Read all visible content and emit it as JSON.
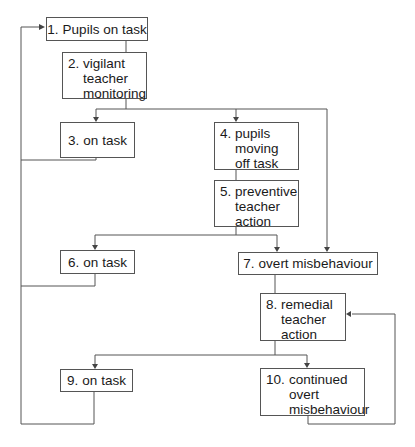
{
  "diagram": {
    "type": "flowchart",
    "nodes": [
      {
        "id": 1,
        "num": "1.",
        "label": "Pupils on task"
      },
      {
        "id": 2,
        "num": "2.",
        "label": "vigilant teacher monitoring",
        "lines": [
          "vigilant",
          "teacher",
          "monitoring"
        ]
      },
      {
        "id": 3,
        "num": "3.",
        "label": "on task"
      },
      {
        "id": 4,
        "num": "4.",
        "label": "pupils moving off task",
        "lines": [
          "pupils",
          "moving",
          "off task"
        ]
      },
      {
        "id": 5,
        "num": "5.",
        "label": "preventive teacher action",
        "lines": [
          "preventive",
          "teacher",
          "action"
        ]
      },
      {
        "id": 6,
        "num": "6.",
        "label": "on task"
      },
      {
        "id": 7,
        "num": "7.",
        "label": "overt misbehaviour"
      },
      {
        "id": 8,
        "num": "8.",
        "label": "remedial teacher action",
        "lines": [
          "remedial",
          "teacher",
          "action"
        ]
      },
      {
        "id": 9,
        "num": "9.",
        "label": "on task"
      },
      {
        "id": 10,
        "num": "10.",
        "label": "continued overt misbehaviour",
        "lines": [
          "continued",
          "overt",
          "misbehaviour"
        ]
      }
    ],
    "edges": [
      {
        "from": 1,
        "to": 2
      },
      {
        "from": 2,
        "to": 3
      },
      {
        "from": 2,
        "to": 4
      },
      {
        "from": 2,
        "to": 7
      },
      {
        "from": 4,
        "to": 5
      },
      {
        "from": 5,
        "to": 6
      },
      {
        "from": 5,
        "to": 7
      },
      {
        "from": 7,
        "to": 8
      },
      {
        "from": 8,
        "to": 9
      },
      {
        "from": 8,
        "to": 10
      },
      {
        "from": 10,
        "to": 8
      },
      {
        "from": 3,
        "to": 1
      },
      {
        "from": 6,
        "to": 1
      },
      {
        "from": 9,
        "to": 1
      }
    ],
    "colors": {
      "line": "#555555",
      "text": "#1a1a1a",
      "background": "#ffffff"
    }
  }
}
